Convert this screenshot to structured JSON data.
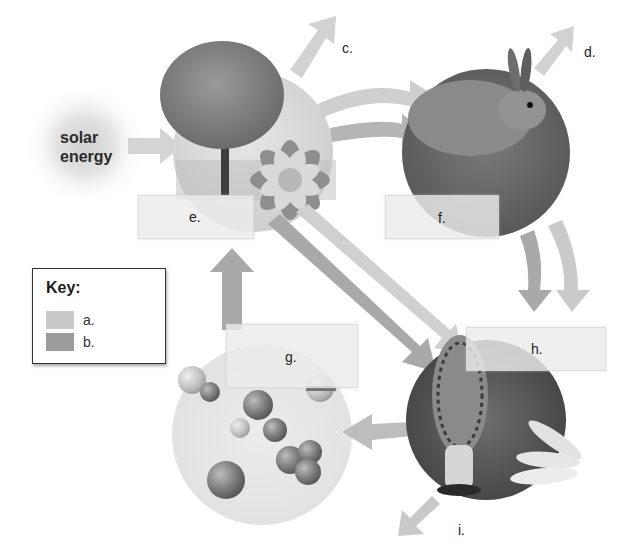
{
  "diagram": {
    "source_label": "solar energy",
    "source_lines": [
      "solar",
      "energy"
    ],
    "colors": {
      "arrow_a": "#c9c9c9",
      "arrow_b": "#9c9c9c",
      "background": "#ffffff",
      "label_box": "#ececec"
    },
    "nodes": [
      {
        "id": "producers",
        "label_box": "e.",
        "depicts": "tree and flower"
      },
      {
        "id": "consumers",
        "label_box": "f.",
        "depicts": "rabbit"
      },
      {
        "id": "nutrients",
        "label_box": "g.",
        "depicts": "molecules"
      },
      {
        "id": "decomposers",
        "label_box": "h.",
        "depicts": "morel mushroom and larvae"
      }
    ],
    "arrow_labels": {
      "c": "c.",
      "d": "d.",
      "i": "i."
    },
    "labels": {
      "e": "e.",
      "f": "f.",
      "g": "g.",
      "h": "h."
    }
  },
  "key": {
    "title": "Key:",
    "items": [
      {
        "label": "a.",
        "color": "#c9c9c9"
      },
      {
        "label": "b.",
        "color": "#9c9c9c"
      }
    ]
  }
}
